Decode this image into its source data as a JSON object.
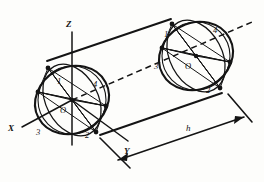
{
  "figure": {
    "type": "technical-line-drawing",
    "background_color": "#fdfdfb",
    "ink_color": "#141414"
  },
  "axes": {
    "x_label": "X",
    "y_label": "Y",
    "z_label": "Z"
  },
  "dimension": {
    "height_label": "h"
  },
  "front_face": {
    "center_label": "O",
    "points": [
      "1",
      "2",
      "3",
      "4"
    ]
  },
  "back_face": {
    "center_label": "O",
    "points": [
      "1",
      "2",
      "3",
      "4"
    ]
  },
  "labels": {
    "axis_z": "Z",
    "axis_x": "X",
    "axis_y": "Y",
    "dim_h": "h",
    "front_center": "O",
    "front_p1": "1",
    "front_p2": "2",
    "front_p3": "3",
    "front_p4": "4",
    "back_center": "O",
    "back_p1": "1",
    "back_p2": "2",
    "back_p3": "3",
    "back_p4": "4"
  }
}
